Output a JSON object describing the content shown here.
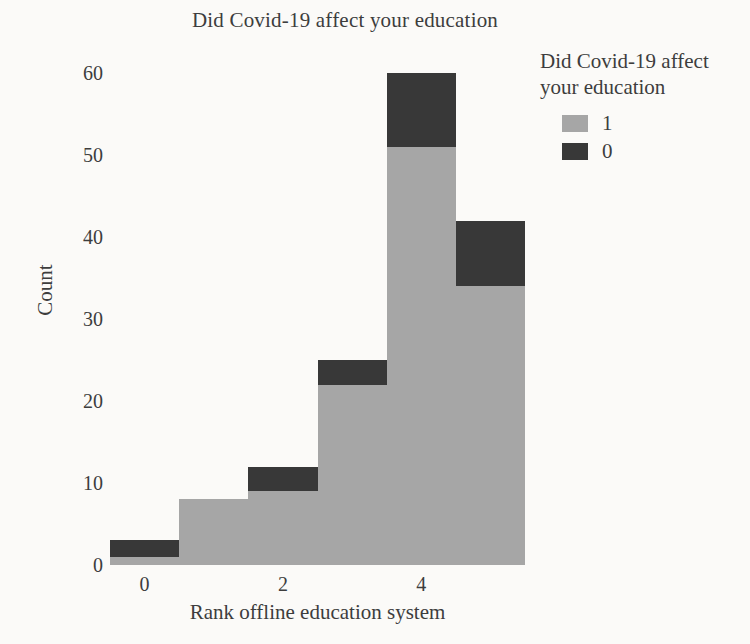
{
  "chart_data": {
    "type": "bar",
    "stacked": true,
    "title": "Did Covid-19 affect your education",
    "xlabel": "Rank offline education system",
    "ylabel": "Count",
    "legend_title": "Did Covid-19 affect your education",
    "categories": [
      0,
      1,
      2,
      3,
      4,
      5
    ],
    "series": [
      {
        "name": "1",
        "color": "#a6a6a6",
        "values": [
          1,
          8,
          9,
          22,
          51,
          34
        ]
      },
      {
        "name": "0",
        "color": "#383838",
        "values": [
          2,
          0,
          3,
          3,
          9,
          8
        ]
      }
    ],
    "totals": [
      3,
      8,
      12,
      25,
      60,
      42
    ],
    "ylim": [
      0,
      63
    ],
    "yticks": [
      0,
      10,
      20,
      30,
      40,
      50,
      60
    ],
    "xticks": [
      0,
      2,
      4
    ],
    "legend_position": "upper-right-outside",
    "grid": false,
    "colors": {
      "text": "#3d3d3d",
      "series_1": "#a6a6a6",
      "series_0": "#383838",
      "background": "#fbfaf8"
    }
  }
}
